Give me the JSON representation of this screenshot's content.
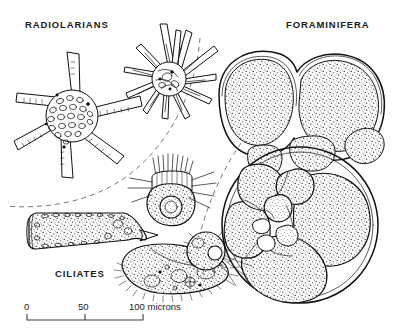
{
  "figure": {
    "kind": "scientific-line-plate",
    "background_color": "#ffffff",
    "ink_color": "#111111",
    "label_color": "#1a1a1a",
    "divider_color": "#555555",
    "width": 397,
    "height": 335
  },
  "labels": {
    "radiolarians": "RADIOLARIANS",
    "foraminifera": "FORAMINIFERA",
    "ciliates": "CILIATES"
  },
  "scale": {
    "ticks": [
      {
        "value": "0",
        "x": 27
      },
      {
        "value": "50",
        "x": 85
      },
      {
        "value": "100 microns",
        "x": 143
      }
    ],
    "start_x": 27,
    "end_x": 143,
    "bar_y": 320,
    "label_y": 310,
    "unit": "microns",
    "span_value": 100
  },
  "organisms": [
    {
      "id": "radiolarian-star",
      "group": "radiolarians",
      "common_name": "star-shaped radiolarian",
      "texture": "reticulate-pores",
      "spines": 6
    },
    {
      "id": "radiolarian-spiny",
      "group": "radiolarians",
      "common_name": "spiny radiolarian",
      "texture": "fine-spines",
      "spines": 22
    },
    {
      "id": "foraminifer-upper",
      "group": "foraminifera",
      "common_name": "globigerinid foraminifer",
      "texture": "stipple",
      "chambers": 4
    },
    {
      "id": "foraminifer-lower",
      "group": "foraminifera",
      "common_name": "spiral foraminifer",
      "texture": "stipple",
      "chambers": 8
    },
    {
      "id": "ciliate-tintinnid",
      "group": "ciliates",
      "common_name": "tintinnid in lorica",
      "texture": "stipple"
    },
    {
      "id": "ciliate-crowned",
      "group": "ciliates",
      "common_name": "crowned ciliate with macronucleus",
      "texture": "stipple"
    },
    {
      "id": "ciliate-paramecium",
      "group": "ciliates",
      "common_name": "paramecium-like ciliate",
      "texture": "stipple"
    },
    {
      "id": "ciliate-small-round",
      "group": "ciliates",
      "common_name": "small round ciliate",
      "texture": "stipple"
    }
  ]
}
